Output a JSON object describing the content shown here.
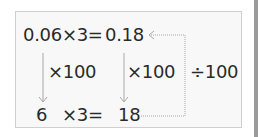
{
  "diagram": {
    "top_equation": {
      "left": "0.06×3=",
      "result": "0.18"
    },
    "bottom_equation": {
      "left": "6",
      "op": "×3=",
      "result": "18"
    },
    "arrows": {
      "left_multiplier": "×100",
      "middle_multiplier": "×100",
      "right_divisor": "÷100"
    },
    "colors": {
      "border": "#cfcfcf",
      "background": "#f8f8f8",
      "arrow": "#a8a8a8",
      "text": "#2a2a2a"
    }
  }
}
